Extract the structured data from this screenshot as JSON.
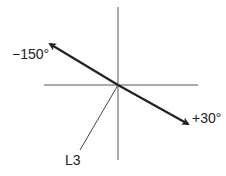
{
  "diagram": {
    "labels": {
      "neg_angle": "−150°",
      "pos_angle": "+30°",
      "lead": "L3"
    },
    "colors": {
      "axis": "#555555",
      "vector": "#222222"
    }
  }
}
